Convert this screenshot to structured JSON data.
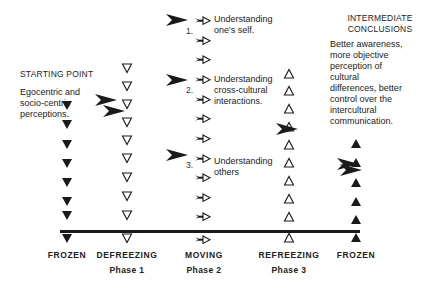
{
  "diagram": {
    "starting_point": {
      "title": "STARTING POINT",
      "lines": [
        "Egocentric and",
        "socio-centric",
        "perceptions."
      ]
    },
    "intermediate_conclusions": {
      "title_lines": [
        "INTERMEDIATE",
        "CONCLUSIONS"
      ],
      "lines": [
        "Better awareness,",
        "more objective",
        "perception of",
        "cultural",
        "differences, better",
        "control over the",
        "intercultural",
        "communication."
      ]
    },
    "steps": [
      {
        "number": "1.",
        "lines": [
          "Understanding",
          "one's self."
        ]
      },
      {
        "number": "2.",
        "lines": [
          "Understanding",
          "cross-cultural",
          "interactions."
        ]
      },
      {
        "number": "3.",
        "lines": [
          "Understanding",
          "others"
        ]
      }
    ],
    "stages": [
      {
        "label": "FROZEN",
        "phase": "",
        "symbol": "filled-down-triangle"
      },
      {
        "label": "DEFREEZING",
        "phase": "Phase 1",
        "symbol": "open-down-triangle"
      },
      {
        "label": "MOVING",
        "phase": "Phase 2",
        "symbol": "feathered-arrow"
      },
      {
        "label": "REFREEZING",
        "phase": "Phase 3",
        "symbol": "open-up-triangle"
      },
      {
        "label": "FROZEN",
        "phase": "",
        "symbol": "filled-up-triangle"
      }
    ],
    "colors": {
      "ink": "#1a1a1a",
      "background": "#ffffff"
    }
  }
}
